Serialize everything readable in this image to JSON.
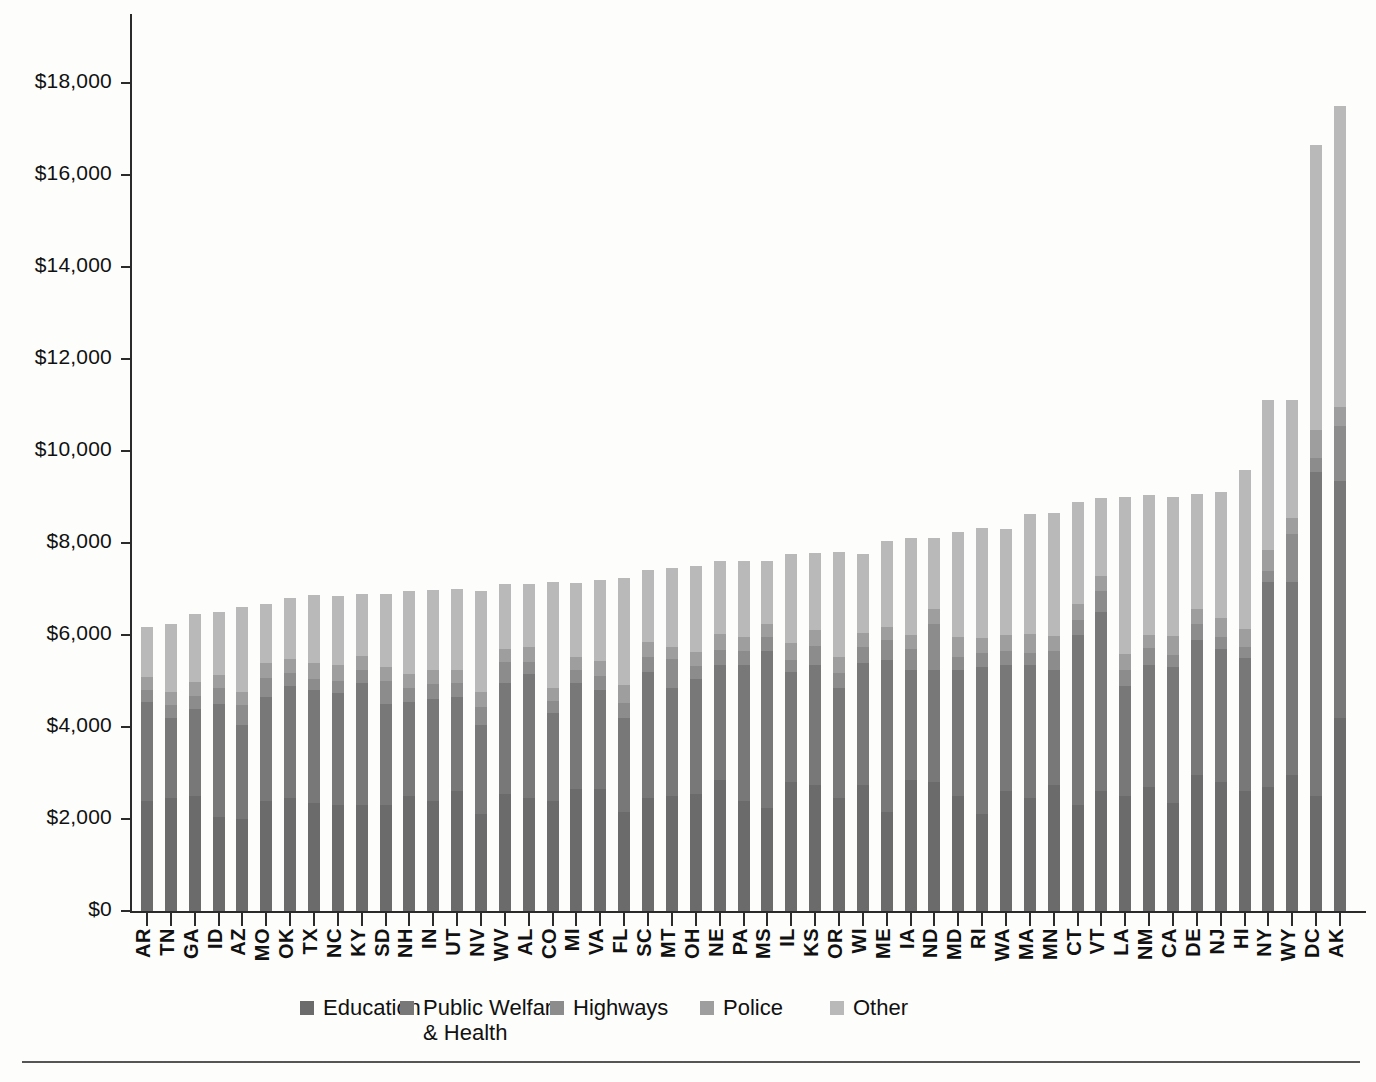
{
  "chart_data": {
    "type": "bar",
    "stacked": true,
    "title": "",
    "subtitle": "",
    "xlabel": "",
    "ylabel": "",
    "ylim": [
      0,
      19500
    ],
    "ytick_values": [
      0,
      2000,
      4000,
      6000,
      8000,
      10000,
      12000,
      14000,
      16000,
      18000
    ],
    "ytick_labels": [
      "$0",
      "$2,000",
      "$4,000",
      "$6,000",
      "$8,000",
      "$10,000",
      "$12,000",
      "$14,000",
      "$16,000",
      "$18,000"
    ],
    "grid": false,
    "legend_position": "bottom",
    "categories": [
      "AR",
      "TN",
      "GA",
      "ID",
      "AZ",
      "MO",
      "OK",
      "TX",
      "NC",
      "KY",
      "SD",
      "NH",
      "IN",
      "UT",
      "NV",
      "WV",
      "AL",
      "CO",
      "MI",
      "VA",
      "FL",
      "SC",
      "MT",
      "OH",
      "NE",
      "PA",
      "MS",
      "IL",
      "KS",
      "OR",
      "WI",
      "ME",
      "IA",
      "ND",
      "MD",
      "RI",
      "WA",
      "MA",
      "MN",
      "CT",
      "VT",
      "LA",
      "NM",
      "CA",
      "DE",
      "NJ",
      "HI",
      "NY",
      "WY",
      "DC",
      "AK"
    ],
    "series": [
      {
        "name": "Education",
        "color": "#6b6b6b",
        "values": [
          2400,
          2450,
          2500,
          2050,
          2000,
          2400,
          2450,
          2350,
          2300,
          2300,
          2300,
          2500,
          2400,
          2600,
          2100,
          2550,
          2450,
          2400,
          2650,
          2650,
          2150,
          2450,
          2500,
          2550,
          2850,
          2400,
          2250,
          2800,
          2750,
          2450,
          2750,
          2150,
          2850,
          2800,
          2500,
          2100,
          2600,
          2450,
          2750,
          2300,
          2600,
          2500,
          2700,
          2350,
          2950,
          2800,
          2600,
          2700,
          2950,
          2500,
          4200
        ]
      },
      {
        "name": "Public Welfare & Health",
        "color": "#787878",
        "values": [
          2150,
          1750,
          1900,
          2450,
          2050,
          2250,
          2450,
          2450,
          2450,
          2650,
          2200,
          2050,
          2200,
          2050,
          1950,
          2400,
          2700,
          1900,
          2300,
          2150,
          2050,
          2750,
          2350,
          2500,
          2500,
          2950,
          3400,
          2400,
          2600,
          2400,
          2650,
          3300,
          2400,
          2450,
          2750,
          3200,
          2750,
          2900,
          2500,
          3700,
          3900,
          2400,
          2650,
          2950,
          2950,
          2900,
          2900,
          4450,
          4200,
          7050,
          5150
        ]
      },
      {
        "name": "Highways",
        "color": "#8c8c8c",
        "values": [
          250,
          280,
          280,
          350,
          420,
          420,
          280,
          250,
          250,
          300,
          500,
          300,
          330,
          300,
          380,
          470,
          260,
          260,
          280,
          300,
          320,
          330,
          620,
          270,
          320,
          300,
          300,
          250,
          420,
          330,
          350,
          440,
          450,
          1000,
          280,
          300,
          300,
          270,
          400,
          320,
          450,
          330,
          360,
          270,
          340,
          260,
          230,
          250,
          1050,
          300,
          1200
        ]
      },
      {
        "name": "Police",
        "color": "#9e9e9e",
        "values": [
          280,
          280,
          300,
          280,
          300,
          320,
          300,
          350,
          350,
          300,
          300,
          300,
          300,
          300,
          330,
          280,
          330,
          280,
          300,
          330,
          400,
          320,
          280,
          320,
          350,
          300,
          280,
          380,
          330,
          350,
          300,
          280,
          300,
          320,
          420,
          330,
          350,
          400,
          320,
          350,
          330,
          350,
          300,
          420,
          330,
          420,
          400,
          450,
          350,
          600,
          400
        ]
      },
      {
        "name": "Other",
        "color": "#b9b9b9",
        "values": [
          1100,
          1490,
          1470,
          1370,
          1830,
          1290,
          1320,
          1460,
          1500,
          1350,
          1600,
          1800,
          1750,
          1740,
          2200,
          1400,
          1360,
          2310,
          1600,
          1770,
          2310,
          1560,
          1700,
          1860,
          1580,
          1650,
          1380,
          1930,
          1680,
          2270,
          1710,
          1880,
          2100,
          1540,
          2300,
          2400,
          2300,
          2620,
          2680,
          2220,
          1700,
          3420,
          3030,
          3020,
          2490,
          2720,
          3450,
          3250,
          2550,
          6200,
          6550
        ]
      }
    ]
  },
  "legend": {
    "items": [
      {
        "label": "Education",
        "color": "#6b6b6b"
      },
      {
        "label": "Public Welfare\n& Health",
        "color": "#787878"
      },
      {
        "label": "Highways",
        "color": "#8c8c8c"
      },
      {
        "label": "Police",
        "color": "#9e9e9e"
      },
      {
        "label": "Other",
        "color": "#b9b9b9"
      }
    ]
  },
  "axis": {
    "y_labels": [
      "$18,000",
      "$16,000",
      "$14,000",
      "$12,000",
      "$10,000",
      "$8,000",
      "$6,000",
      "$4,000",
      "$2,000",
      "$0"
    ]
  }
}
